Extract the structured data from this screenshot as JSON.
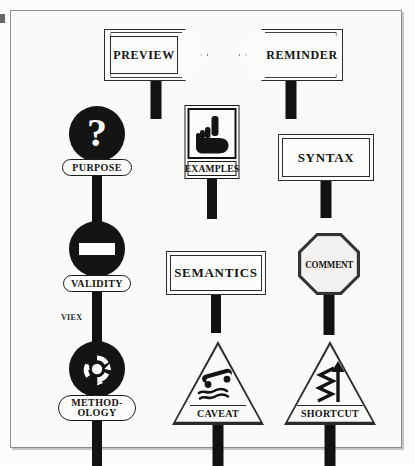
{
  "figure": {
    "background_color": "#fbfbfa",
    "frame_color": "#8e8e8e",
    "ink_color": "#141414",
    "stray_label": "VIEX"
  },
  "signs": [
    {
      "id": "preview",
      "label": "PREVIEW",
      "shape": "arrow-right",
      "icon": "arrow-right-sign",
      "row": 1,
      "column": 1
    },
    {
      "id": "reminder",
      "label": "REMINDER",
      "shape": "arrow-left",
      "icon": "arrow-left-sign",
      "row": 1,
      "column": 2
    },
    {
      "id": "purpose",
      "label": "PURPOSE",
      "shape": "circle",
      "icon": "question-mark-icon",
      "glyph": "?",
      "row": 2,
      "column": 1
    },
    {
      "id": "examples",
      "label": "EXAMPLES",
      "shape": "square",
      "icon": "pointing-hand-icon",
      "row": 2,
      "column": 2
    },
    {
      "id": "syntax",
      "label": "SYNTAX",
      "shape": "rectangle",
      "icon": "rectangular-plate-sign",
      "row": 2,
      "column": 3
    },
    {
      "id": "validity",
      "label": "VALIDITY",
      "shape": "circle",
      "icon": "no-entry-icon",
      "row": 3,
      "column": 1
    },
    {
      "id": "semantics",
      "label": "SEMANTICS",
      "shape": "rectangle",
      "icon": "rectangular-plate-sign",
      "row": 3,
      "column": 2
    },
    {
      "id": "comment",
      "label": "COMMENT",
      "shape": "octagon",
      "icon": "stop-sign-octagon-icon",
      "row": 3,
      "column": 3
    },
    {
      "id": "methodology",
      "label_line_1": "METHOD-",
      "label_line_2": "OLOGY",
      "shape": "circle",
      "icon": "circular-arrows-roundabout-icon",
      "row": 4,
      "column": 1
    },
    {
      "id": "caveat",
      "label": "CAVEAT",
      "shape": "triangle",
      "icon": "slippery-road-icon",
      "row": 4,
      "column": 2
    },
    {
      "id": "shortcut",
      "label": "SHORTCUT",
      "shape": "triangle",
      "icon": "winding-road-arrow-icon",
      "row": 4,
      "column": 3
    }
  ]
}
